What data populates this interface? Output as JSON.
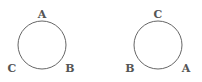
{
  "diagrams": [
    {
      "name": "left",
      "circle": {
        "cx": 42,
        "cy": 45,
        "r": 24
      },
      "labels": [
        {
          "text": "A",
          "x": 42,
          "y": 18
        },
        {
          "text": "C",
          "x": 12,
          "y": 72
        },
        {
          "text": "B",
          "x": 70,
          "y": 72
        }
      ]
    },
    {
      "name": "right",
      "circle": {
        "cx": 158,
        "cy": 45,
        "r": 24
      },
      "labels": [
        {
          "text": "C",
          "x": 158,
          "y": 18
        },
        {
          "text": "B",
          "x": 130,
          "y": 72
        },
        {
          "text": "A",
          "x": 186,
          "y": 72
        }
      ]
    }
  ],
  "colors": {
    "stroke": "#666666",
    "label": "#555555"
  }
}
